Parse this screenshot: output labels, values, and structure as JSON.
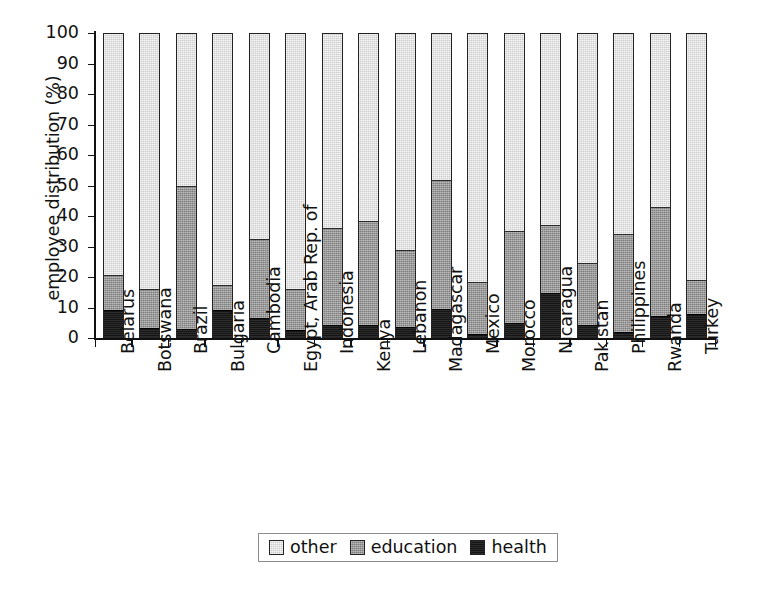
{
  "chart_data": {
    "type": "bar",
    "subtype": "stacked-bar-100-percent",
    "title": "",
    "xlabel": "",
    "ylabel": "employee distribution (%)",
    "ylim": [
      0,
      100
    ],
    "ytick_step": 10,
    "grid": false,
    "legend_position": "bottom-center",
    "categories": [
      "Belarus",
      "Botswana",
      "Brazil",
      "Bulgaria",
      "Cambodia",
      "Egypt, Arab Rep. of",
      "Indonesia",
      "Kenya",
      "Lebanon",
      "Madagascar",
      "Mexico",
      "Morocco",
      "Nicaragua",
      "Pakistan",
      "Philippines",
      "Rwanda",
      "Turkey"
    ],
    "yticks": [
      "0",
      "10",
      "20",
      "30",
      "40",
      "50",
      "60",
      "70",
      "80",
      "90",
      "100"
    ],
    "series": [
      {
        "name": "health",
        "color": "#151515",
        "values": [
          8.8,
          3.0,
          2.6,
          9.0,
          6.2,
          2.2,
          4.0,
          4.0,
          3.2,
          9.2,
          1.0,
          4.6,
          14.5,
          4.0,
          1.8,
          7.0,
          7.5
        ]
      },
      {
        "name": "education",
        "color": "#7d7d7d",
        "values": [
          11.8,
          13.0,
          47.4,
          8.0,
          26.0,
          13.8,
          32.0,
          34.4,
          25.5,
          42.6,
          17.0,
          30.4,
          22.5,
          20.5,
          32.2,
          36.0,
          11.2
        ]
      },
      {
        "name": "other",
        "color": "#cdcdcd",
        "values": [
          79.4,
          84.0,
          50.0,
          83.0,
          67.8,
          84.0,
          64.0,
          61.6,
          71.3,
          48.2,
          82.0,
          65.0,
          63.0,
          75.5,
          66.0,
          57.0,
          81.3
        ]
      }
    ],
    "stack_tops": {
      "health_plus_education": [
        20.6,
        16.0,
        50.0,
        17.0,
        32.2,
        16.0,
        36.0,
        38.4,
        28.7,
        51.8,
        18.0,
        35.0,
        37.0,
        24.5,
        34.0,
        43.0,
        18.7
      ]
    }
  },
  "legend": {
    "entries": [
      {
        "label": "other",
        "swatch": "light-gray-swatch-icon"
      },
      {
        "label": "education",
        "swatch": "medium-gray-swatch-icon"
      },
      {
        "label": "health",
        "swatch": "black-swatch-icon"
      }
    ]
  },
  "colors": {
    "other": "#cdcdcd",
    "education": "#7d7d7d",
    "health": "#151515",
    "axis": "#111111",
    "background": "#ffffff"
  }
}
